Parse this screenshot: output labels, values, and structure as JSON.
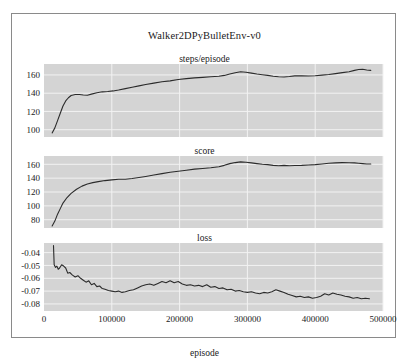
{
  "figure": {
    "title": "Walker2DPyBulletEnv-v0",
    "xlabel": "episode",
    "background": "#ffffff",
    "panel_background": "#d4d4d4",
    "grid_color": "#f2f2f2",
    "line_color": "#2b2b2b",
    "frame_color": "#8a8a8a"
  },
  "chart_data": [
    {
      "type": "line",
      "title": "steps/episode",
      "xlabel": "episode",
      "ylabel": "",
      "xlim": [
        0,
        500000
      ],
      "ylim": [
        92,
        172
      ],
      "xticks": [
        0,
        100000,
        200000,
        300000,
        400000,
        500000
      ],
      "xticklabels": [
        "0",
        "100000",
        "200000",
        "300000",
        "400000",
        "500000"
      ],
      "yticks": [
        100,
        120,
        140,
        160
      ],
      "yticklabels": [
        "100",
        "120",
        "140",
        "160"
      ],
      "grid": true,
      "legend": "none",
      "x": [
        12000,
        16000,
        20000,
        24000,
        28000,
        32000,
        36000,
        40000,
        46000,
        52000,
        58000,
        64000,
        70000,
        78000,
        86000,
        94000,
        102000,
        110000,
        120000,
        130000,
        140000,
        150000,
        162000,
        174000,
        186000,
        198000,
        210000,
        222000,
        234000,
        246000,
        258000,
        266000,
        274000,
        282000,
        290000,
        298000,
        306000,
        314000,
        322000,
        330000,
        338000,
        346000,
        354000,
        362000,
        370000,
        380000,
        390000,
        400000,
        410000,
        420000,
        430000,
        440000,
        450000,
        458000,
        464000,
        470000,
        476000,
        482000
      ],
      "values": [
        96.5,
        102,
        110,
        118,
        126,
        131.5,
        135,
        137.5,
        138.5,
        138.5,
        138,
        137.8,
        139,
        140.5,
        141.5,
        141.8,
        142.5,
        143.5,
        145,
        146.5,
        148,
        149.5,
        151,
        152.5,
        153.5,
        155,
        156,
        156.8,
        157.3,
        158,
        158.5,
        159.5,
        161,
        162.5,
        163.5,
        163,
        162,
        161,
        160.3,
        159.5,
        158.5,
        158,
        157.8,
        158.3,
        159,
        159,
        158.8,
        159.2,
        159.8,
        160.5,
        161.5,
        162.5,
        163.5,
        165,
        166,
        166.3,
        165.5,
        165
      ]
    },
    {
      "type": "line",
      "title": "score",
      "xlabel": "episode",
      "ylabel": "",
      "xlim": [
        0,
        500000
      ],
      "ylim": [
        68,
        172
      ],
      "xticks": [
        0,
        100000,
        200000,
        300000,
        400000,
        500000
      ],
      "xticklabels": [
        "0",
        "100000",
        "200000",
        "300000",
        "400000",
        "500000"
      ],
      "yticks": [
        80,
        100,
        120,
        140,
        160
      ],
      "yticklabels": [
        "80",
        "100",
        "120",
        "140",
        "160"
      ],
      "grid": true,
      "legend": "none",
      "x": [
        12000,
        16000,
        20000,
        24000,
        28000,
        34000,
        40000,
        48000,
        56000,
        64000,
        72000,
        80000,
        90000,
        100000,
        110000,
        120000,
        130000,
        140000,
        150000,
        162000,
        174000,
        186000,
        198000,
        210000,
        222000,
        234000,
        246000,
        258000,
        266000,
        274000,
        282000,
        290000,
        298000,
        306000,
        314000,
        322000,
        330000,
        338000,
        346000,
        354000,
        362000,
        370000,
        380000,
        390000,
        400000,
        410000,
        420000,
        430000,
        440000,
        450000,
        458000,
        464000,
        470000,
        476000,
        482000
      ],
      "values": [
        71,
        78,
        88,
        96,
        104,
        112,
        118,
        124,
        128.5,
        131.5,
        133.5,
        135,
        136.5,
        137.5,
        138.5,
        138.5,
        139.5,
        141,
        142.5,
        144.5,
        146.5,
        148.5,
        150,
        151.5,
        153,
        154,
        155,
        156.5,
        158.5,
        161,
        162.5,
        163.5,
        163,
        162,
        161,
        160,
        159.5,
        158.5,
        158,
        158.5,
        158,
        158.3,
        158.5,
        159,
        159.5,
        160.5,
        161.5,
        162,
        162.5,
        162.3,
        162,
        161.5,
        161,
        160.5,
        160.5
      ]
    },
    {
      "type": "line",
      "title": "loss",
      "xlabel": "episode",
      "ylabel": "",
      "xlim": [
        0,
        500000
      ],
      "ylim": [
        -0.0855,
        -0.0325
      ],
      "xticks": [
        0,
        100000,
        200000,
        300000,
        400000,
        500000
      ],
      "xticklabels": [
        "0",
        "100000",
        "200000",
        "300000",
        "400000",
        "500000"
      ],
      "yticks": [
        -0.04,
        -0.05,
        -0.06,
        -0.07,
        -0.08
      ],
      "yticklabels": [
        "-0.04",
        "-0.05",
        "-0.06",
        "-0.07",
        "-0.08"
      ],
      "grid": true,
      "legend": "none",
      "x": [
        14000,
        15000,
        17000,
        19000,
        21000,
        23000,
        26000,
        29000,
        32000,
        35000,
        38000,
        42000,
        46000,
        50000,
        54000,
        58000,
        62000,
        66000,
        70000,
        74000,
        78000,
        82000,
        86000,
        90000,
        95000,
        100000,
        105000,
        110000,
        115000,
        120000,
        126000,
        132000,
        138000,
        144000,
        150000,
        156000,
        162000,
        168000,
        174000,
        180000,
        186000,
        192000,
        198000,
        204000,
        210000,
        216000,
        222000,
        228000,
        234000,
        240000,
        246000,
        252000,
        258000,
        264000,
        270000,
        276000,
        282000,
        288000,
        294000,
        300000,
        306000,
        312000,
        318000,
        324000,
        330000,
        336000,
        342000,
        348000,
        354000,
        360000,
        366000,
        372000,
        378000,
        384000,
        390000,
        396000,
        402000,
        408000,
        414000,
        420000,
        426000,
        432000,
        438000,
        444000,
        450000,
        456000,
        462000,
        468000,
        474000,
        480000
      ],
      "values": [
        -0.0345,
        -0.0495,
        -0.0515,
        -0.0505,
        -0.053,
        -0.052,
        -0.0495,
        -0.0505,
        -0.052,
        -0.056,
        -0.0555,
        -0.0575,
        -0.059,
        -0.058,
        -0.06,
        -0.0615,
        -0.063,
        -0.062,
        -0.065,
        -0.064,
        -0.0665,
        -0.066,
        -0.068,
        -0.0685,
        -0.0695,
        -0.07,
        -0.0705,
        -0.07,
        -0.071,
        -0.0705,
        -0.0695,
        -0.069,
        -0.0675,
        -0.066,
        -0.065,
        -0.0645,
        -0.0655,
        -0.064,
        -0.0625,
        -0.0635,
        -0.062,
        -0.0635,
        -0.0625,
        -0.0645,
        -0.0655,
        -0.065,
        -0.066,
        -0.0655,
        -0.0665,
        -0.065,
        -0.067,
        -0.0665,
        -0.068,
        -0.0675,
        -0.069,
        -0.0685,
        -0.07,
        -0.0695,
        -0.0705,
        -0.071,
        -0.0705,
        -0.0715,
        -0.072,
        -0.071,
        -0.0715,
        -0.0705,
        -0.069,
        -0.07,
        -0.071,
        -0.0725,
        -0.0735,
        -0.0745,
        -0.074,
        -0.075,
        -0.0745,
        -0.0755,
        -0.075,
        -0.074,
        -0.072,
        -0.073,
        -0.0715,
        -0.0725,
        -0.073,
        -0.074,
        -0.0745,
        -0.0755,
        -0.075,
        -0.076,
        -0.0755,
        -0.076
      ]
    }
  ]
}
